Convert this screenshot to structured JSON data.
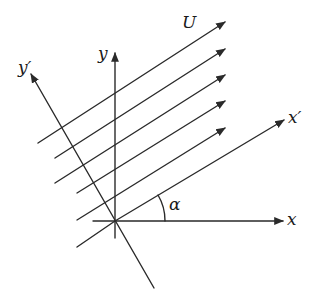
{
  "diagram": {
    "labels": {
      "flow": "U",
      "x_axis": "x",
      "y_axis": "y",
      "x_prime_axis": "x′",
      "y_prime_axis": "y′",
      "angle": "α"
    },
    "stroke_color": "#2a2a2a",
    "text_color": "#1a1a1a",
    "background": "#ffffff",
    "origin": [
      115,
      221
    ],
    "axes": {
      "x": {
        "from": [
          93,
          221
        ],
        "to": [
          283,
          221
        ]
      },
      "y": {
        "from": [
          115,
          238
        ],
        "to": [
          115,
          53
        ]
      },
      "x_prime": {
        "from": [
          115,
          221
        ],
        "to": [
          284,
          120
        ]
      },
      "y_prime": {
        "from": [
          154,
          288
        ],
        "to": [
          31,
          74
        ]
      }
    },
    "streamlines": [
      {
        "from": [
          38,
          143
        ],
        "to": [
          225,
          22
        ]
      },
      {
        "from": [
          55,
          158
        ],
        "to": [
          225,
          49
        ]
      },
      {
        "from": [
          55,
          183
        ],
        "to": [
          225,
          75
        ]
      },
      {
        "from": [
          77,
          193
        ],
        "to": [
          225,
          101
        ]
      },
      {
        "from": [
          77,
          220
        ],
        "to": [
          225,
          128
        ]
      },
      {
        "from": [
          77,
          247
        ],
        "to": [
          115,
          221
        ]
      }
    ],
    "angle_arc": {
      "center": [
        115,
        221
      ],
      "radius": 50
    }
  }
}
